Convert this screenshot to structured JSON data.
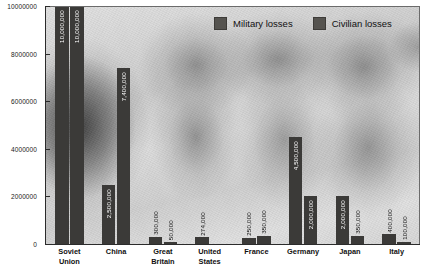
{
  "chart_data": {
    "type": "bar",
    "title": "",
    "subtitle": "",
    "xlabel": "",
    "ylabel": "",
    "ylim": [
      0,
      10000000
    ],
    "grid": false,
    "legend_position": "top-right",
    "axis": {
      "y_ticks": [
        {
          "value": 10000000,
          "label": "10000000"
        },
        {
          "value": 8000000,
          "label": "8000000"
        },
        {
          "value": 6000000,
          "label": "6000000"
        },
        {
          "value": 4000000,
          "label": "4000000"
        },
        {
          "value": 2000000,
          "label": "2000000"
        },
        {
          "value": 0,
          "label": "0"
        }
      ]
    },
    "categories": [
      "Soviet Union",
      "China",
      "Great Britain",
      "United States",
      "France",
      "Germany",
      "Japan",
      "Italy"
    ],
    "category_lines": [
      [
        "Soviet",
        "Union"
      ],
      [
        "China"
      ],
      [
        "Great",
        "Britain"
      ],
      [
        "United",
        "States"
      ],
      [
        "France"
      ],
      [
        "Germany"
      ],
      [
        "Japan"
      ],
      [
        "Italy"
      ]
    ],
    "series": [
      {
        "name": "Military losses",
        "color": "#3b3a38",
        "values": [
          10000000,
          2500000,
          300000,
          274000,
          250000,
          4500000,
          2000000,
          400000
        ],
        "value_labels": [
          "10,000,000",
          "2,500,000",
          "300,000",
          "274,000",
          "250,000",
          "4,500,000",
          "2,000,000",
          "400,000"
        ]
      },
      {
        "name": "Civilian losses",
        "color": "#3b3a38",
        "values": [
          10000000,
          7400000,
          50000,
          0,
          350000,
          2000000,
          350000,
          100000
        ],
        "value_labels": [
          "10,000,000",
          "7,400,000",
          "50,000",
          "",
          "350,000",
          "2,000,000",
          "350,000",
          "100,000"
        ]
      }
    ]
  },
  "legend": {
    "entries": [
      {
        "label": "Military losses",
        "color": "#55534f"
      },
      {
        "label": "Civilian losses",
        "color": "#55534f"
      }
    ]
  },
  "colors": {
    "bar": "#3b3a38",
    "axis": "#2b2b2b",
    "value_text_inside": "#ffffff",
    "value_text_outside": "#111111",
    "background": "#ffffff"
  }
}
